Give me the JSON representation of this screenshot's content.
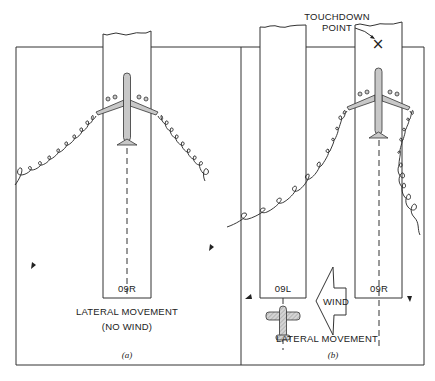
{
  "figure": {
    "panel_a": {
      "runway_label": "09R",
      "title_line1": "LATERAL MOVEMENT",
      "title_line2": "(NO WIND)",
      "caption": "(a)"
    },
    "panel_b": {
      "touchdown_line1": "TOUCHDOWN",
      "touchdown_line2": "POINT",
      "touchdown_marker": "×",
      "runway_left_label": "09L",
      "runway_right_label": "09R",
      "wind_label": "WIND",
      "title": "LATERAL MOVEMENT",
      "caption": "(b)"
    },
    "icons": {
      "large_aircraft": "airplane-icon",
      "small_aircraft": "airplane-icon",
      "wind_arrow": "arrow-left-icon"
    }
  }
}
